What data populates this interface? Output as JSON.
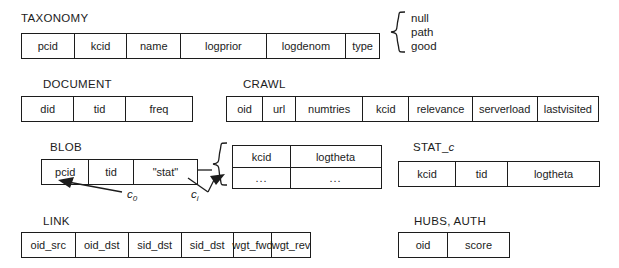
{
  "figure": {
    "stroke_color": "#1c1c1c",
    "background_color": "#ffffff"
  },
  "tables": {
    "taxonomy": {
      "caption": "TAXONOMY",
      "columns": [
        "pcid",
        "kcid",
        "name",
        "logprior",
        "logdenom",
        "type"
      ],
      "type_domain": [
        "null",
        "path",
        "good"
      ]
    },
    "document": {
      "caption": "DOCUMENT",
      "columns": [
        "did",
        "tid",
        "freq"
      ]
    },
    "crawl": {
      "caption": "CRAWL",
      "columns": [
        "oid",
        "url",
        "numtries",
        "kcid",
        "relevance",
        "serverload",
        "lastvisited"
      ]
    },
    "blob": {
      "caption": "BLOB",
      "columns": [
        "pcid",
        "tid",
        "\"stat\""
      ],
      "edge_labels": {
        "first": "c",
        "first_sub": "0",
        "ith": "c",
        "ith_sub": "i"
      }
    },
    "blob_expansion": {
      "columns": [
        "kcid",
        "logtheta"
      ],
      "rows": [
        [
          "...",
          "..."
        ]
      ]
    },
    "stat_c": {
      "caption_prefix": "STAT_",
      "caption_italic": "c",
      "columns": [
        "kcid",
        "tid",
        "logtheta"
      ]
    },
    "link": {
      "caption": "LINK",
      "columns": [
        "oid_src",
        "oid_dst",
        "sid_dst",
        "sid_dst",
        "wgt_fwd",
        "wgt_rev"
      ]
    },
    "hubs_auth": {
      "caption": "HUBS, AUTH",
      "columns": [
        "oid",
        "score"
      ]
    }
  }
}
